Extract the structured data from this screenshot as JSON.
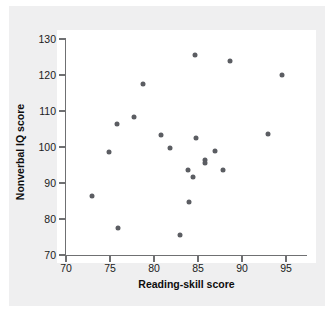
{
  "figure": {
    "background_color": "#efeff0",
    "panel_color": "#ffffff",
    "axis_color": "#6f7072",
    "point_color": "#5b5d62"
  },
  "chart_data": {
    "type": "scatter",
    "title": "",
    "xlabel": "Reading-skill score",
    "ylabel": "Nonverbal IQ score",
    "xlim": [
      70,
      95.5
    ],
    "ylim": [
      70,
      131
    ],
    "xticks": [
      70,
      75,
      80,
      85,
      90,
      95
    ],
    "yticks": [
      70,
      80,
      90,
      100,
      110,
      120,
      130
    ],
    "xtick_labels": [
      "70",
      "75",
      "80",
      "85",
      "90",
      "95"
    ],
    "ytick_labels": [
      "70",
      "80",
      "90",
      "100",
      "110",
      "120",
      "130"
    ],
    "grid": false,
    "legend": null,
    "marker": "circle",
    "n_points": 23,
    "points": [
      {
        "x": 72.9,
        "y": 86.4
      },
      {
        "x": 74.9,
        "y": 98.6
      },
      {
        "x": 75.8,
        "y": 106.4
      },
      {
        "x": 75.9,
        "y": 77.4
      },
      {
        "x": 77.7,
        "y": 108.4
      },
      {
        "x": 78.7,
        "y": 117.5
      },
      {
        "x": 80.8,
        "y": 103.3
      },
      {
        "x": 81.8,
        "y": 99.8
      },
      {
        "x": 83.0,
        "y": 75.6
      },
      {
        "x": 83.9,
        "y": 93.6
      },
      {
        "x": 84.0,
        "y": 84.6
      },
      {
        "x": 84.4,
        "y": 91.7
      },
      {
        "x": 84.7,
        "y": 125.6
      },
      {
        "x": 84.8,
        "y": 102.6
      },
      {
        "x": 85.8,
        "y": 96.5
      },
      {
        "x": 85.8,
        "y": 95.5
      },
      {
        "x": 86.9,
        "y": 98.9
      },
      {
        "x": 87.8,
        "y": 93.6
      },
      {
        "x": 88.6,
        "y": 123.8
      },
      {
        "x": 92.9,
        "y": 103.7
      },
      {
        "x": 94.6,
        "y": 120.0
      }
    ]
  }
}
